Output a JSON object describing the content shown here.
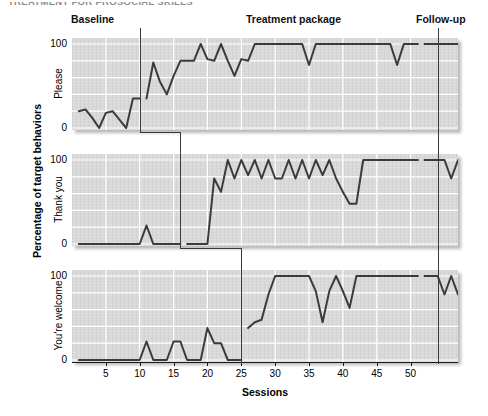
{
  "figure": {
    "cut_off_title": "TREATMENT FOR PROSOCIAL SKILLS",
    "xlabel": "Sessions",
    "ylabel": "Percentage of target behaviors"
  },
  "phases": [
    {
      "name": "baseline",
      "label": "Baseline"
    },
    {
      "name": "treatment",
      "label": "Treatment package"
    },
    {
      "name": "followup",
      "label": "Follow-up"
    }
  ],
  "axis": {
    "xticks": [
      5,
      10,
      15,
      20,
      25,
      30,
      35,
      40,
      45,
      50
    ],
    "yticks": [
      0,
      100
    ],
    "ylim": [
      0,
      100
    ],
    "xlim": [
      0,
      57
    ]
  },
  "chart_data": {
    "type": "line",
    "title": "TREATMENT FOR PROSOCIAL SKILLS",
    "xlabel": "Sessions",
    "ylabel": "Percentage of target behaviors",
    "ylim": [
      0,
      100
    ],
    "xlim": [
      0,
      57
    ],
    "grid": true,
    "legend": "none",
    "design": "multiple-baseline-across-behaviors",
    "annotations": [
      {
        "text": "Baseline",
        "position": "top-left"
      },
      {
        "text": "Treatment package",
        "position": "top-center"
      },
      {
        "text": "Follow-up",
        "position": "top-right"
      }
    ],
    "phase_lines": [
      {
        "panel": "Please",
        "x": 10,
        "after_session": 10
      },
      {
        "panel": "Thank you",
        "x": 16,
        "after_session": 16
      },
      {
        "panel": "You're welcome",
        "x": 25,
        "after_session": 25
      },
      {
        "panel": "all",
        "x": 54,
        "after_session": 54,
        "note": "follow-up"
      }
    ],
    "series": [
      {
        "name": "Please",
        "ylabel": "Please",
        "x": [
          1,
          2,
          3,
          4,
          5,
          6,
          7,
          8,
          9,
          10,
          11,
          12,
          13,
          14,
          15,
          16,
          17,
          18,
          19,
          20,
          21,
          22,
          23,
          24,
          25,
          26,
          27,
          28,
          29,
          30,
          31,
          32,
          33,
          34,
          35,
          36,
          37,
          38,
          39,
          40,
          41,
          42,
          43,
          44,
          45,
          46,
          47,
          48,
          49,
          50,
          51,
          52,
          53,
          54,
          55,
          56,
          57
        ],
        "values": [
          20,
          22,
          12,
          0,
          18,
          20,
          10,
          0,
          35,
          35,
          35,
          78,
          55,
          40,
          62,
          80,
          80,
          80,
          100,
          82,
          80,
          100,
          80,
          62,
          82,
          80,
          100,
          100,
          100,
          100,
          100,
          100,
          100,
          100,
          75,
          100,
          100,
          100,
          100,
          100,
          100,
          100,
          100,
          100,
          100,
          100,
          100,
          75,
          100,
          100,
          100,
          100,
          100,
          100,
          100,
          100,
          100
        ]
      },
      {
        "name": "Thank you",
        "ylabel": "Thank you",
        "x": [
          1,
          2,
          3,
          4,
          5,
          6,
          7,
          8,
          9,
          10,
          11,
          12,
          13,
          14,
          15,
          16,
          17,
          18,
          19,
          20,
          21,
          22,
          23,
          24,
          25,
          26,
          27,
          28,
          29,
          30,
          31,
          32,
          33,
          34,
          35,
          36,
          37,
          38,
          39,
          40,
          41,
          42,
          43,
          44,
          45,
          46,
          47,
          48,
          49,
          50,
          51,
          52,
          53,
          54,
          55,
          56,
          57
        ],
        "values": [
          0,
          0,
          0,
          0,
          0,
          0,
          0,
          0,
          0,
          0,
          22,
          0,
          0,
          0,
          0,
          0,
          0,
          0,
          0,
          0,
          78,
          62,
          100,
          78,
          100,
          82,
          100,
          78,
          100,
          78,
          78,
          100,
          78,
          100,
          78,
          100,
          82,
          100,
          78,
          62,
          48,
          48,
          100,
          100,
          100,
          100,
          100,
          100,
          100,
          100,
          100,
          100,
          100,
          100,
          100,
          78,
          100
        ]
      },
      {
        "name": "You're welcome",
        "ylabel": "You're welcome",
        "x": [
          1,
          2,
          3,
          4,
          5,
          6,
          7,
          8,
          9,
          10,
          11,
          12,
          13,
          14,
          15,
          16,
          17,
          18,
          19,
          20,
          21,
          22,
          23,
          24,
          25,
          26,
          27,
          28,
          29,
          30,
          31,
          32,
          33,
          34,
          35,
          36,
          37,
          38,
          39,
          40,
          41,
          42,
          43,
          44,
          45,
          46,
          47,
          48,
          49,
          50,
          51,
          52,
          53,
          54,
          55,
          56,
          57
        ],
        "values": [
          0,
          0,
          0,
          0,
          0,
          0,
          0,
          0,
          0,
          0,
          22,
          0,
          0,
          0,
          22,
          22,
          0,
          0,
          0,
          38,
          20,
          20,
          0,
          0,
          0,
          38,
          45,
          48,
          78,
          100,
          100,
          100,
          100,
          100,
          100,
          82,
          45,
          82,
          100,
          82,
          62,
          100,
          100,
          100,
          100,
          100,
          100,
          100,
          100,
          100,
          100,
          100,
          100,
          100,
          78,
          100,
          78
        ]
      }
    ]
  }
}
